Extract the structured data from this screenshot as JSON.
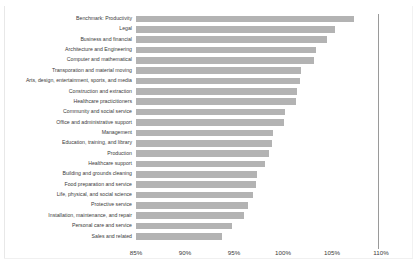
{
  "chart_data": {
    "type": "bar",
    "orientation": "horizontal",
    "title": "",
    "xlabel": "",
    "ylabel": "",
    "xlim": [
      85,
      110
    ],
    "xticks": [
      85,
      90,
      95,
      100,
      105,
      110
    ],
    "xtick_labels": [
      "85%",
      "90%",
      "95%",
      "100%",
      "105%",
      "110%"
    ],
    "grid": false,
    "legend": "none",
    "value_suffix": "%",
    "benchmark_line": 107.5,
    "bar_color": "#b3b3b3",
    "categories": [
      "Benchmark: Productivity",
      "Legal",
      "Business and financial",
      "Architecture and Engineering",
      "Computer and mathematical",
      "Transporation and material moving",
      "Arts, design, entertainment, sports, and media",
      "Construction and extraction",
      "Healthcare practicitioners",
      "Community and social service",
      "Office and administrative support",
      "Management",
      "Education, training, and library",
      "Production",
      "Healthcare support",
      "Building and grounds cleaning",
      "Food preparation and service",
      "Life, physical, and social science",
      "Protective service",
      "Installation, maintenance, and repair",
      "Personal care and service",
      "Sales and related"
    ],
    "values": [
      107.2,
      105.3,
      104.5,
      103.4,
      103.2,
      101.8,
      101.7,
      101.4,
      101.3,
      100.2,
      100.1,
      99.0,
      98.9,
      98.6,
      98.2,
      97.3,
      97.2,
      96.9,
      96.4,
      96.0,
      94.8,
      93.8
    ]
  }
}
